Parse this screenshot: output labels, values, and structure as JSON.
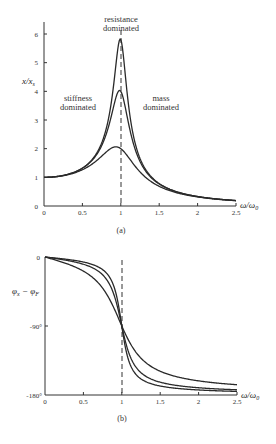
{
  "chart_data": [
    {
      "id": "a",
      "type": "line",
      "title": "",
      "caption": "(a)",
      "xlabel": "ω/ω0",
      "ylabel": "x/xs",
      "xlim": [
        0,
        2.5
      ],
      "ylim": [
        0,
        6
      ],
      "xticks": [
        "0",
        "0.5",
        "1",
        "1.5",
        "2",
        "2.5"
      ],
      "yticks": [
        "0",
        "1",
        "2",
        "3",
        "4",
        "5",
        "6"
      ],
      "grid": false,
      "annotations": [
        {
          "text_lines": [
            "resistance",
            "dominated"
          ],
          "x": 1.0,
          "y": 6.3
        },
        {
          "text_lines": [
            "stiffness",
            "dominated"
          ],
          "x": 0.45,
          "y": 3.6
        },
        {
          "text_lines": [
            "mass",
            "dominated"
          ],
          "x": 1.55,
          "y": 3.6
        }
      ],
      "vline": {
        "x": 1.0,
        "style": "dashed"
      },
      "x": [
        0,
        0.25,
        0.5,
        0.75,
        1.0,
        1.25,
        1.5,
        2.0,
        2.5
      ],
      "series": [
        {
          "name": "Q≈5.8",
          "q": 5.8,
          "values": [
            1.0,
            1.066,
            1.33,
            2.26,
            5.8,
            1.74,
            0.79,
            0.33,
            0.19
          ]
        },
        {
          "name": "Q≈4",
          "q": 4.0,
          "values": [
            1.0,
            1.066,
            1.32,
            2.17,
            4.0,
            1.67,
            0.78,
            0.33,
            0.19
          ]
        },
        {
          "name": "Q≈2",
          "q": 2.0,
          "values": [
            1.0,
            1.06,
            1.26,
            1.74,
            2.0,
            1.33,
            0.71,
            0.32,
            0.19
          ]
        }
      ]
    },
    {
      "id": "b",
      "type": "line",
      "title": "",
      "caption": "(b)",
      "xlabel": "ω/ω0",
      "ylabel": "φx − φF",
      "xlim": [
        0,
        2.5
      ],
      "ylim": [
        -180,
        0
      ],
      "xticks": [
        "0",
        "0.5",
        "1",
        "1.5",
        "2",
        "2.5"
      ],
      "yticks": [
        "0",
        "-90°",
        "-180°"
      ],
      "grid": false,
      "vline": {
        "x": 1.0,
        "style": "dashed"
      },
      "x": [
        0,
        0.25,
        0.5,
        0.75,
        1.0,
        1.25,
        1.5,
        2.0,
        2.5
      ],
      "series": [
        {
          "name": "Q≈5.8",
          "q": 5.8,
          "values": [
            0,
            -2.6,
            -6.6,
            -17.1,
            -90,
            -163.4,
            -173.4,
            -177.3,
            -178.9
          ]
        },
        {
          "name": "Q≈4",
          "q": 4.0,
          "values": [
            0,
            -3.8,
            -9.5,
            -24.2,
            -90,
            -156.1,
            -170.5,
            -175.2,
            -176.9
          ]
        },
        {
          "name": "Q≈2",
          "q": 2.0,
          "values": [
            0,
            -7.6,
            -18.4,
            -40.6,
            -90,
            -138.0,
            -154.3,
            -161.6,
            -163.8
          ]
        }
      ]
    }
  ],
  "labels": {
    "a_xlabel_main": "ω/ω",
    "a_xlabel_sub": "0",
    "a_ylabel_main": "x/x",
    "a_ylabel_sub": "s",
    "b_xlabel_main": "ω/ω",
    "b_xlabel_sub": "0",
    "b_ylabel_part1": "φ",
    "b_ylabel_sub1": "x",
    "b_ylabel_mid": " − φ",
    "b_ylabel_sub2": "F",
    "annot_resistance_1": "resistance",
    "annot_resistance_2": "dominated",
    "annot_stiffness_1": "stiffness",
    "annot_stiffness_2": "dominated",
    "annot_mass_1": "mass",
    "annot_mass_2": "dominated",
    "caption_a": "(a)",
    "caption_b": "(b)",
    "b_ytick_0": "0",
    "b_ytick_90": "-90°",
    "b_ytick_180": "-180°"
  }
}
